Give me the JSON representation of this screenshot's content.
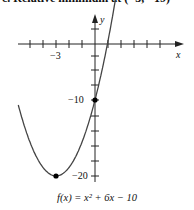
{
  "header": {
    "cut_text": "c. Relative minimum at (−3, −19)"
  },
  "chart_data": {
    "type": "line",
    "title": "",
    "function": "f(x) = x^2 + 6x - 10",
    "caption": "f(x) = x² + 6x − 10",
    "xlabel": "x",
    "ylabel": "y",
    "x_tick_labels": [
      {
        "value": -3,
        "label": "−3"
      }
    ],
    "y_tick_labels": [
      {
        "value": -10,
        "label": "−10"
      },
      {
        "value": -20,
        "label": "−20"
      }
    ],
    "x_ticks": [
      -5,
      -4,
      -3,
      -2,
      -1,
      1,
      2,
      3,
      4,
      5
    ],
    "y_ticks_step": 2,
    "xlim": [
      -6,
      6.5
    ],
    "ylim": [
      -21,
      3
    ],
    "grid": false,
    "marked_points": [
      {
        "x": 0,
        "y": -10,
        "label": "y-intercept"
      },
      {
        "x": -3,
        "y": -19,
        "label": "relative minimum"
      }
    ],
    "x_range_drawn": [
      -5.9,
      1.8
    ],
    "color": "#444444"
  },
  "labels": {
    "x_axis": "x",
    "y_axis": "y",
    "neg3": "−3",
    "neg10": "−10",
    "neg20": "−20",
    "formula": "f(x) = x² + 6x − 10"
  }
}
